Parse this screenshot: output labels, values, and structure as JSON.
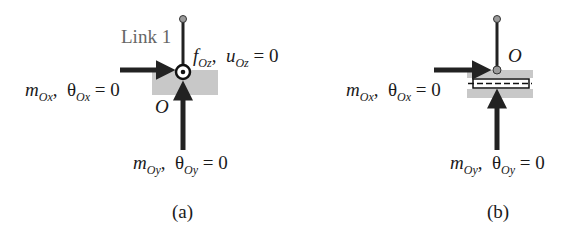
{
  "panel_a": {
    "caption": "(a)",
    "link_label": "Link 1",
    "origin_label": "O",
    "force_z": {
      "sym": "f",
      "sub": "Oz",
      "sep": ",",
      "disp_sym": "u",
      "disp_sub": "Oz",
      "eq": "= 0"
    },
    "moment_x": {
      "sym": "m",
      "sub": "Ox",
      "sep": ",",
      "angle_sym": "θ",
      "angle_sub": "Ox",
      "eq": "= 0"
    },
    "moment_y": {
      "sym": "m",
      "sub": "Oy",
      "sep": ",",
      "angle_sym": "θ",
      "angle_sub": "Oy",
      "eq": "= 0"
    }
  },
  "panel_b": {
    "caption": "(b)",
    "origin_label": "O",
    "moment_x": {
      "sym": "m",
      "sub": "Ox",
      "sep": ",",
      "angle_sym": "θ",
      "angle_sub": "Ox",
      "eq": "= 0"
    },
    "moment_y": {
      "sym": "m",
      "sub": "Oy",
      "sep": ",",
      "angle_sym": "θ",
      "angle_sub": "Oy",
      "eq": "= 0"
    }
  },
  "colors": {
    "ground": "#c8c8c8",
    "link": "#222222",
    "joint_dot": "#9a9a9a",
    "arrow": "#222222"
  }
}
